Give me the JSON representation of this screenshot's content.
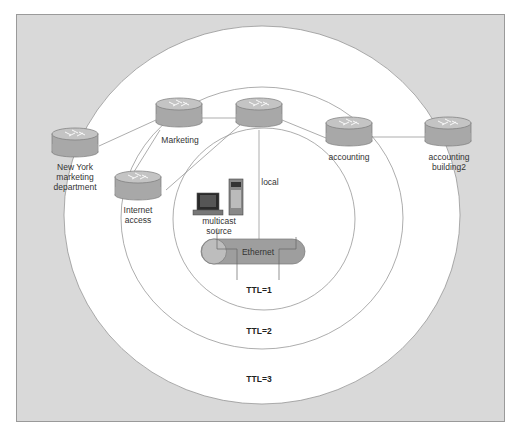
{
  "diagram": {
    "colors": {
      "frame_bg": "#d9d9d9",
      "frame_border": "#9a9a9a",
      "ring_fill": "#ffffff",
      "ring_stroke": "#8a8a8a",
      "router_side": "#a8a8a8",
      "router_top": "#c4c4c4",
      "ethernet_fill": "#9e9e9e"
    },
    "routers": [
      {
        "id": "ny-marketing",
        "label_lines": [
          "New York",
          "marketing",
          "department"
        ]
      },
      {
        "id": "marketing",
        "label_lines": [
          "Marketing"
        ]
      },
      {
        "id": "local",
        "label_lines": [
          "local"
        ]
      },
      {
        "id": "accounting",
        "label_lines": [
          "accounting"
        ]
      },
      {
        "id": "accounting-building2",
        "label_lines": [
          "accounting",
          "building2"
        ]
      },
      {
        "id": "internet-access",
        "label_lines": [
          "Internet",
          "access"
        ]
      }
    ],
    "source": {
      "label_lines": [
        "multicast",
        "source"
      ]
    },
    "ethernet": {
      "label": "Ethernet"
    },
    "ttl_zones": [
      {
        "label": "TTL=1"
      },
      {
        "label": "TTL=2"
      },
      {
        "label": "TTL=3"
      }
    ]
  }
}
